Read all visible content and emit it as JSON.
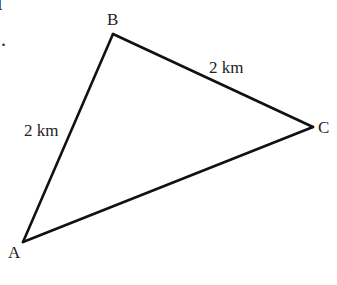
{
  "diagram": {
    "type": "triangle",
    "stroke_color": "#111111",
    "text_color": "#222222",
    "vertices": [
      {
        "id": "A",
        "label": "A",
        "x": 23,
        "y": 242,
        "label_x": 8,
        "label_y": 258
      },
      {
        "id": "B",
        "label": "B",
        "x": 113,
        "y": 34,
        "label_x": 107,
        "label_y": 25
      },
      {
        "id": "C",
        "label": "C",
        "x": 313,
        "y": 127,
        "label_x": 318,
        "label_y": 133
      }
    ],
    "edges": [
      {
        "from": "A",
        "to": "B",
        "label": "2 km",
        "label_x": 24,
        "label_y": 136
      },
      {
        "from": "B",
        "to": "C",
        "label": "2 km",
        "label_x": 209,
        "label_y": 73
      },
      {
        "from": "C",
        "to": "A",
        "label": ""
      }
    ],
    "cropped_text": [
      {
        "text": "l",
        "x": 0,
        "y": 10
      },
      {
        "text": ".",
        "x": 2,
        "y": 46
      }
    ]
  }
}
